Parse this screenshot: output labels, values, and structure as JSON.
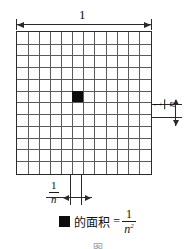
{
  "figure": {
    "title_label": "1",
    "grid": {
      "columns": 12,
      "rows": 12,
      "filled_cell": {
        "col": 6,
        "row": 6
      },
      "fill_color": "#0d0d0d",
      "line_color": "#5a5a5a",
      "border_color": "#2a2a2a"
    },
    "dimensions": {
      "top": {
        "label": "1"
      },
      "right": {
        "numerator": "1",
        "denominator": "n"
      },
      "bottom": {
        "numerator": "1",
        "denominator": "n"
      }
    },
    "caption": {
      "swatch_icon": "black-square-icon",
      "text": "的面积",
      "equals": "=",
      "numerator": "1",
      "denominator": "n",
      "exponent": "2"
    },
    "figure_number": "图"
  }
}
